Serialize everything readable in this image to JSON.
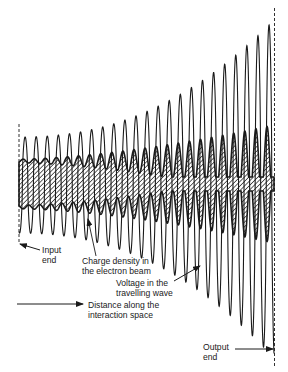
{
  "figure": {
    "type": "travelling-wave tube interaction diagram",
    "labels": {
      "input_end": [
        "Input",
        "end"
      ],
      "charge_density": [
        "Charge density in",
        "the electron beam"
      ],
      "voltage": [
        "Voltage in the",
        "travelling wave"
      ],
      "distance": [
        "Distance along the",
        "interaction space"
      ],
      "output_end": [
        "Output",
        "end"
      ]
    },
    "wave": {
      "cycles": 23,
      "x_start": 19,
      "x_end": 274,
      "center_y": 185,
      "amplitude_start": 48,
      "amplitude_end": 165
    },
    "beam": {
      "half_width_start": 19,
      "modulation_end": 38
    },
    "colors": {
      "ink": "#1a1a1a",
      "background": "#ffffff"
    }
  }
}
